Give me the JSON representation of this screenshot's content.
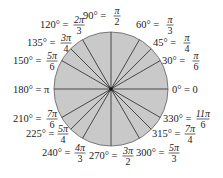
{
  "diagram": {
    "center": {
      "x": 111,
      "y": 89
    },
    "radius": 57,
    "colors": {
      "fill": "#c9c9c9",
      "stroke": "#3a3a3a",
      "outline": "#7a7a7a",
      "text": "#222222"
    },
    "angles": [
      {
        "deg": 0,
        "deg_label": "0° = ",
        "rad_num": "0",
        "rad_den": "",
        "simple": true,
        "lx": 172,
        "ly": 93,
        "fx": 0
      },
      {
        "deg": 30,
        "deg_label": "30° = ",
        "rad_num": "π",
        "rad_den": "6",
        "simple": false,
        "lx": 162,
        "ly": 64,
        "fx": 196
      },
      {
        "deg": 45,
        "deg_label": "45° = ",
        "rad_num": "π",
        "rad_den": "4",
        "simple": false,
        "lx": 153,
        "ly": 46,
        "fx": 187
      },
      {
        "deg": 60,
        "deg_label": "60° = ",
        "rad_num": "π",
        "rad_den": "3",
        "simple": false,
        "lx": 136,
        "ly": 28,
        "fx": 170
      },
      {
        "deg": 90,
        "deg_label": "90° = ",
        "rad_num": "π",
        "rad_den": "2",
        "simple": false,
        "lx": 83,
        "ly": 19,
        "fx": 117
      },
      {
        "deg": 120,
        "deg_label": "120° = ",
        "rad_num": "2π",
        "rad_den": "3",
        "simple": false,
        "lx": 40,
        "ly": 28,
        "fx": 79
      },
      {
        "deg": 135,
        "deg_label": "135° = ",
        "rad_num": "3π",
        "rad_den": "4",
        "simple": false,
        "lx": 27,
        "ly": 46,
        "fx": 66
      },
      {
        "deg": 150,
        "deg_label": "150° = ",
        "rad_num": "5π",
        "rad_den": "6",
        "simple": false,
        "lx": 13,
        "ly": 64,
        "fx": 52
      },
      {
        "deg": 180,
        "deg_label": "180° = ",
        "rad_num": "π",
        "rad_den": "",
        "simple": true,
        "lx": 13,
        "ly": 93,
        "fx": 0
      },
      {
        "deg": 210,
        "deg_label": "210° = ",
        "rad_num": "7π",
        "rad_den": "6",
        "simple": false,
        "lx": 13,
        "ly": 122,
        "fx": 52
      },
      {
        "deg": 225,
        "deg_label": "225° = ",
        "rad_num": "5π",
        "rad_den": "4",
        "simple": false,
        "lx": 26,
        "ly": 137,
        "fx": 63
      },
      {
        "deg": 240,
        "deg_label": "240° = ",
        "rad_num": "4π",
        "rad_den": "3",
        "simple": false,
        "lx": 42,
        "ly": 156,
        "fx": 80
      },
      {
        "deg": 270,
        "deg_label": "270° = ",
        "rad_num": "3π",
        "rad_den": "2",
        "simple": false,
        "lx": 89,
        "ly": 159,
        "fx": 128
      },
      {
        "deg": 300,
        "deg_label": "300° = ",
        "rad_num": "5π",
        "rad_den": "3",
        "simple": false,
        "lx": 136,
        "ly": 156,
        "fx": 174
      },
      {
        "deg": 315,
        "deg_label": "315° = ",
        "rad_num": "7π",
        "rad_den": "4",
        "simple": false,
        "lx": 152,
        "ly": 137,
        "fx": 190
      },
      {
        "deg": 330,
        "deg_label": "330° = ",
        "rad_num": "11π",
        "rad_den": "6",
        "simple": false,
        "lx": 163,
        "ly": 122,
        "fx": 203
      }
    ]
  }
}
